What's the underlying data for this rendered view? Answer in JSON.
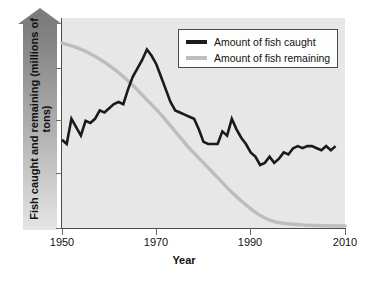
{
  "chart_data": {
    "type": "line",
    "title": "",
    "xlabel": "Year",
    "ylabel": "Fish caught and remaining (millions of tons)",
    "xlim": [
      1950,
      2010
    ],
    "xticks": [
      1950,
      1970,
      1990,
      2010
    ],
    "xtick_labels": [
      "1950",
      "1970",
      "1990",
      "2010"
    ],
    "ylim": [
      0,
      100
    ],
    "yticks": [
      0,
      25,
      50,
      75,
      100
    ],
    "ytick_labels": [
      "",
      "",
      "",
      "",
      ""
    ],
    "grid": false,
    "legend_position": "top-right",
    "series": [
      {
        "name": "Amount of fish caught",
        "color": "#1a1a1a",
        "x": [
          1950,
          1951,
          1952,
          1953,
          1954,
          1955,
          1956,
          1957,
          1958,
          1959,
          1960,
          1961,
          1962,
          1963,
          1964,
          1965,
          1966,
          1967,
          1968,
          1969,
          1970,
          1971,
          1972,
          1973,
          1974,
          1975,
          1976,
          1977,
          1978,
          1979,
          1980,
          1981,
          1982,
          1983,
          1984,
          1985,
          1986,
          1987,
          1988,
          1989,
          1990,
          1991,
          1992,
          1993,
          1994,
          1995,
          1996,
          1997,
          1998,
          1999,
          2000,
          2001,
          2002,
          2003,
          2004,
          2005,
          2006,
          2007,
          2008
        ],
        "values": [
          42,
          40,
          52,
          48,
          44,
          51,
          50,
          52,
          56,
          55,
          57,
          59,
          60,
          59,
          66,
          72,
          76,
          80,
          85,
          82,
          78,
          72,
          66,
          60,
          56,
          55,
          54,
          53,
          52,
          47,
          41,
          40,
          40,
          40,
          46,
          44,
          52,
          47,
          43,
          40,
          36,
          34,
          30,
          31,
          34,
          31,
          33,
          36,
          35,
          38,
          39,
          38,
          39,
          39,
          38,
          37,
          39,
          37,
          39
        ]
      },
      {
        "name": "Amount of fish remaining",
        "color": "#bdbdbd",
        "x": [
          1950,
          1953,
          1956,
          1959,
          1962,
          1965,
          1968,
          1971,
          1974,
          1977,
          1980,
          1983,
          1986,
          1989,
          1992,
          1995,
          1998,
          2001,
          2004,
          2007,
          2010
        ],
        "values": [
          88,
          86,
          83,
          79,
          74,
          68,
          61,
          54,
          46,
          38,
          31,
          24,
          17,
          11,
          6,
          3,
          2,
          1.5,
          1.2,
          1,
          1
        ]
      }
    ]
  },
  "legend": {
    "entries": [
      {
        "label": "Amount of fish caught",
        "color": "#1a1a1a",
        "swatch": "line-swatch-black"
      },
      {
        "label": "Amount of fish remaining",
        "color": "#bdbdbd",
        "swatch": "line-swatch-gray"
      }
    ]
  },
  "axes": {
    "y_axis_label": "Fish caught and remaining (millions of tons)",
    "x_axis_label": "Year",
    "x_tick_labels": [
      "1950",
      "1970",
      "1990",
      "2010"
    ]
  }
}
